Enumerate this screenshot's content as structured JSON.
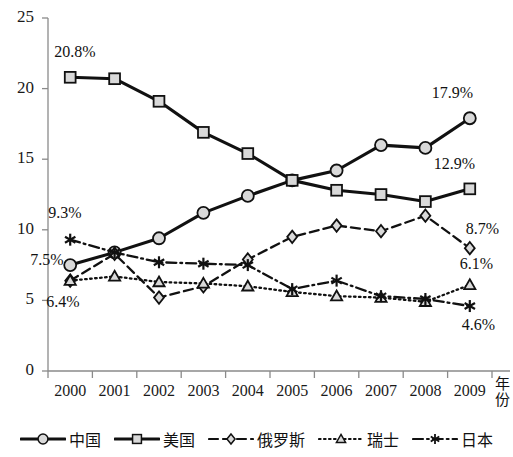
{
  "chart_data": {
    "type": "line",
    "title": "",
    "xlabel": "年份",
    "ylabel": "",
    "categories": [
      "2000",
      "2001",
      "2002",
      "2003",
      "2004",
      "2005",
      "2006",
      "2007",
      "2008",
      "2009"
    ],
    "ylim": [
      0,
      25
    ],
    "yticks": [
      0,
      5,
      10,
      15,
      20,
      25
    ],
    "grid": false,
    "legend_position": "bottom",
    "series": [
      {
        "name": "中国",
        "marker": "circle",
        "linestyle": "solid",
        "values": [
          7.5,
          8.4,
          9.4,
          11.2,
          12.4,
          13.5,
          14.2,
          16.0,
          15.8,
          17.9
        ]
      },
      {
        "name": "美国",
        "marker": "square",
        "linestyle": "solid",
        "values": [
          20.8,
          20.7,
          19.1,
          16.9,
          15.4,
          13.5,
          12.8,
          12.5,
          12.0,
          12.9
        ]
      },
      {
        "name": "俄罗斯",
        "marker": "diamond",
        "linestyle": "dashed",
        "values": [
          6.4,
          8.3,
          5.2,
          6.0,
          7.9,
          9.5,
          10.3,
          9.9,
          11.0,
          8.7
        ]
      },
      {
        "name": "瑞士",
        "marker": "triangle",
        "linestyle": "dotted",
        "values": [
          6.4,
          6.7,
          6.3,
          6.2,
          6.0,
          5.6,
          5.3,
          5.2,
          4.9,
          6.1
        ]
      },
      {
        "name": "日本",
        "marker": "asterisk",
        "linestyle": "dashdot",
        "values": [
          9.3,
          8.4,
          7.7,
          7.6,
          7.5,
          5.8,
          6.4,
          5.3,
          5.1,
          4.6
        ]
      }
    ],
    "annotations": [
      {
        "text": "20.8%",
        "series": "美国",
        "category": "2000"
      },
      {
        "text": "9.3%",
        "series": "日本",
        "category": "2000"
      },
      {
        "text": "7.5%",
        "series": "中国",
        "category": "2000"
      },
      {
        "text": "6.4%",
        "series": "俄罗斯",
        "category": "2000"
      },
      {
        "text": "17.9%",
        "series": "中国",
        "category": "2009"
      },
      {
        "text": "12.9%",
        "series": "美国",
        "category": "2009"
      },
      {
        "text": "8.7%",
        "series": "俄罗斯",
        "category": "2009"
      },
      {
        "text": "6.1%",
        "series": "瑞士",
        "category": "2009"
      },
      {
        "text": "4.6%",
        "series": "日本",
        "category": "2009"
      }
    ]
  },
  "legend": {
    "items": [
      {
        "label": "中国"
      },
      {
        "label": "美国"
      },
      {
        "label": "俄罗斯"
      },
      {
        "label": "瑞士"
      },
      {
        "label": "日本"
      }
    ]
  },
  "colors": {
    "line": "#111111",
    "marker_fill": "#d9d9d9",
    "axis": "#8a8a8a",
    "text": "#111111"
  }
}
